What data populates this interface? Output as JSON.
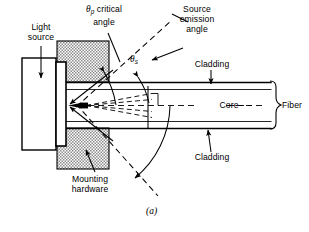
{
  "figure": {
    "caption": "(a)"
  },
  "labels": {
    "light_source": "Light\nsource",
    "mounting_hardware": "Mounting\nhardware",
    "critical_angle_symbol": "θ",
    "critical_angle_subscript": "p",
    "critical_angle_text": " critical\nangle",
    "source_emission_angle": "Source\nemission\nangle",
    "theta_s_symbol": "θ",
    "theta_s_subscript": "s",
    "cladding_top": "Cladding",
    "cladding_bottom": "Cladding",
    "core": "Core",
    "fiber": "Fiber"
  },
  "colors": {
    "line": "#000000",
    "hatch": "#a8a8a8",
    "background": "#ffffff",
    "fiber_outline": "#1a1a1a"
  }
}
